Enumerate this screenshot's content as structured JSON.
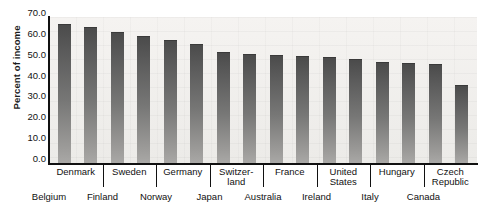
{
  "chart_data": {
    "type": "bar",
    "title": "",
    "subtitle": "",
    "xlabel": "",
    "ylabel": "Percent of income",
    "ylim": [
      0.0,
      70.0
    ],
    "ytick_step": 10.0,
    "grid": false,
    "legend": "none",
    "bar_color": "#6e6d6b",
    "plot_background": "#f2f0ee",
    "axis_color": "#111111",
    "categories": [
      "Belgium",
      "Denmark",
      "Finland",
      "Sweden",
      "Norway",
      "Germany",
      "Japan",
      "Switzerland",
      "Australia",
      "France",
      "Ireland",
      "United States",
      "Italy",
      "Hungary",
      "Canada",
      "Czech Republic"
    ],
    "values": [
      66.5,
      65.0,
      63.0,
      61.0,
      59.0,
      57.0,
      53.0,
      52.5,
      52.0,
      51.5,
      51.0,
      50.0,
      48.5,
      48.0,
      47.5,
      37.5
    ],
    "ytick_labels": [
      "70.0",
      "60.0",
      "50.0",
      "40.0",
      "30.0",
      "20.0",
      "10.0",
      "0.0"
    ],
    "ytick_values": [
      70.0,
      60.0,
      50.0,
      40.0,
      30.0,
      20.0,
      10.0,
      0.0
    ],
    "axis_labels_upper_row": [
      "Denmark",
      "Sweden",
      "Germany",
      "Switzer-\nland",
      "France",
      "United\nStates",
      "Hungary",
      "Czech\nRepublic"
    ],
    "axis_labels_lower_row": [
      "Belgium",
      "Finland",
      "Norway",
      "Japan",
      "Australia",
      "Ireland",
      "Italy",
      "Canada"
    ]
  },
  "axis": {
    "y_title": "Percent of income",
    "y_ticks": [
      {
        "label": "70.0"
      },
      {
        "label": "60.0"
      },
      {
        "label": "50.0"
      },
      {
        "label": "40.0"
      },
      {
        "label": "30.0"
      },
      {
        "label": "20.0"
      },
      {
        "label": "10.0"
      },
      {
        "label": "0.0"
      }
    ]
  },
  "x_labels_upper": [
    {
      "line1": "Denmark",
      "line2": ""
    },
    {
      "line1": "Sweden",
      "line2": ""
    },
    {
      "line1": "Germany",
      "line2": ""
    },
    {
      "line1": "Switzer-",
      "line2": "land"
    },
    {
      "line1": "France",
      "line2": ""
    },
    {
      "line1": "United",
      "line2": "States"
    },
    {
      "line1": "Hungary",
      "line2": ""
    },
    {
      "line1": "Czech",
      "line2": "Republic"
    }
  ],
  "x_labels_lower": [
    {
      "line1": "Belgium"
    },
    {
      "line1": "Finland"
    },
    {
      "line1": "Norway"
    },
    {
      "line1": "Japan"
    },
    {
      "line1": "Australia"
    },
    {
      "line1": "Ireland"
    },
    {
      "line1": "Italy"
    },
    {
      "line1": "Canada"
    }
  ]
}
